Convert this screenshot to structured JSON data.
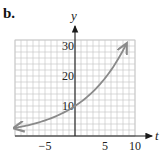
{
  "part_label": "b.",
  "chart_data": {
    "type": "line",
    "title": "",
    "xlabel": "t",
    "ylabel": "y",
    "xlim": [
      -10,
      10
    ],
    "ylim": [
      0,
      32
    ],
    "grid": true,
    "x_grid_step": 1,
    "y_grid_step": 2,
    "x_ticks": [
      -5,
      5,
      10
    ],
    "x_tick_labels": [
      "−5",
      "5",
      "10"
    ],
    "y_ticks": [
      10,
      20,
      30
    ],
    "y_tick_labels": [
      "10",
      "20",
      "30"
    ],
    "series": [
      {
        "name": "exponential growth curve",
        "color": "#8a8a8a",
        "arrows_both_ends": true,
        "x": [
          -10,
          -8,
          -6,
          -4,
          -2,
          0,
          2,
          4,
          6,
          8,
          8.5
        ],
        "values": [
          2.7,
          3.5,
          4.6,
          5.9,
          7.7,
          10,
          13,
          16.9,
          22,
          28.5,
          30.5
        ]
      }
    ],
    "colors": {
      "grid": "#c8c8c8",
      "axis": "#1a1a1a",
      "curve": "#8a8a8a"
    }
  }
}
